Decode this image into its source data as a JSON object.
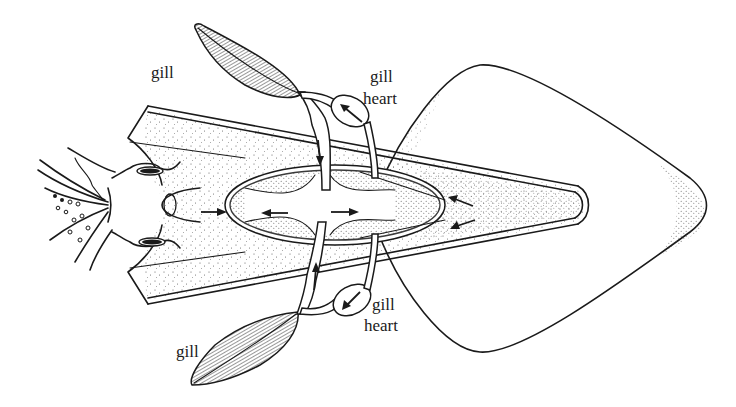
{
  "figure": {
    "labels": {
      "gill_top": "gill",
      "gill_heart_top_line1": "gill",
      "gill_heart_top_line2": "heart",
      "gill_bottom": "gill",
      "gill_heart_bottom_line1": "gill",
      "gill_heart_bottom_line2": "heart"
    },
    "colors": {
      "ink": "#1a1a1a",
      "background": "#ffffff",
      "stipple": "#555555"
    },
    "structures": [
      "head",
      "eyes",
      "arms",
      "mantle",
      "fins",
      "gills",
      "gill hearts",
      "systemic heart",
      "vessels"
    ],
    "flow_arrows": [
      {
        "location": "top gill heart",
        "direction": "up-left"
      },
      {
        "location": "top branchial vessel",
        "direction": "down"
      },
      {
        "location": "bottom gill heart",
        "direction": "down-left"
      },
      {
        "location": "bottom branchial vessel",
        "direction": "up"
      },
      {
        "location": "anterior aorta entry",
        "direction": "right"
      },
      {
        "location": "heart left",
        "direction": "left"
      },
      {
        "location": "heart right",
        "direction": "right"
      },
      {
        "location": "posterior vessel upper",
        "direction": "left"
      },
      {
        "location": "posterior vessel lower",
        "direction": "left"
      }
    ]
  }
}
